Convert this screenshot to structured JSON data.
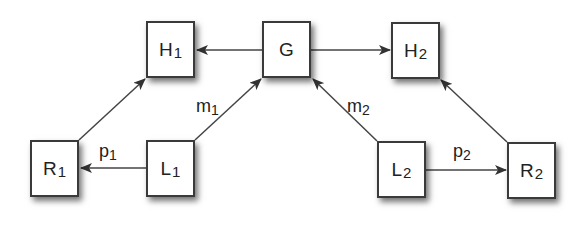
{
  "diagram": {
    "nodes": [
      {
        "id": "H1",
        "base": "H",
        "sub": "1",
        "x": 146,
        "y": 21
      },
      {
        "id": "G",
        "base": "G",
        "sub": "",
        "x": 262,
        "y": 21
      },
      {
        "id": "H2",
        "base": "H",
        "sub": "2",
        "x": 391,
        "y": 22
      },
      {
        "id": "R1",
        "base": "R",
        "sub": "1",
        "x": 30,
        "y": 140
      },
      {
        "id": "L1",
        "base": "L",
        "sub": "1",
        "x": 146,
        "y": 140
      },
      {
        "id": "L2",
        "base": "L",
        "sub": "2",
        "x": 377,
        "y": 141
      },
      {
        "id": "R2",
        "base": "R",
        "sub": "2",
        "x": 507,
        "y": 142
      }
    ],
    "edges": [
      {
        "from": "G",
        "to": "H1",
        "label": ""
      },
      {
        "from": "G",
        "to": "H2",
        "label": ""
      },
      {
        "from": "R1",
        "to": "H1",
        "label": ""
      },
      {
        "from": "L1",
        "to": "G",
        "label": "m1"
      },
      {
        "from": "L1",
        "to": "R1",
        "label": "p1"
      },
      {
        "from": "L2",
        "to": "G",
        "label": "m2"
      },
      {
        "from": "L2",
        "to": "R2",
        "label": "p2"
      },
      {
        "from": "R2",
        "to": "H2",
        "label": ""
      }
    ],
    "labels": {
      "m1": {
        "base": "m",
        "sub": "1"
      },
      "m2": {
        "base": "m",
        "sub": "2"
      },
      "p1": {
        "base": "p",
        "sub": "1"
      },
      "p2": {
        "base": "p",
        "sub": "2"
      }
    },
    "colors": {
      "stroke": "#3a3a3a",
      "fill": "#ffffff",
      "text": "#222222"
    }
  }
}
